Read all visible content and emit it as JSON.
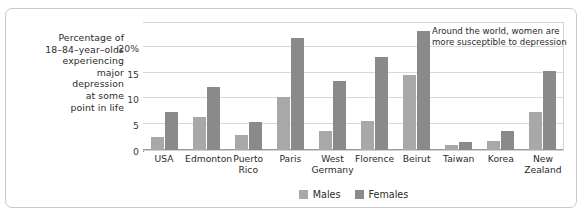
{
  "axis_label": {
    "lines": [
      "Percentage of",
      "18–84–year–olds",
      "experiencing",
      "major",
      "depression",
      "at some",
      "point in life"
    ]
  },
  "annotation": {
    "text": "Around the world, women are more susceptible to depression"
  },
  "legend": {
    "males": "Males",
    "females": "Females"
  },
  "colors": {
    "male_bar": "#a8a8a8",
    "female_bar": "#8a8a8a",
    "gridline": "#d8d8d8",
    "frame": "#c9c9c9",
    "text": "#2b2b2b"
  },
  "chart_data": {
    "type": "bar",
    "title": "",
    "xlabel": "",
    "ylabel": "Percentage of 18–84–year–olds experiencing major depression at some point in life",
    "categories": [
      "USA",
      "Edmonton",
      "Puerto Rico",
      "Paris",
      "West Germany",
      "Florence",
      "Beirut",
      "Taiwan",
      "Korea",
      "New Zealand"
    ],
    "series": [
      {
        "name": "Males",
        "values": [
          2.5,
          6.4,
          3.0,
          10.2,
          3.7,
          5.7,
          14.5,
          1.0,
          1.7,
          7.3
        ]
      },
      {
        "name": "Females",
        "values": [
          7.3,
          12.3,
          5.4,
          21.8,
          13.3,
          18.0,
          23.1,
          1.5,
          3.7,
          15.4
        ]
      }
    ],
    "ylim": [
      0,
      25
    ],
    "yticks": [
      0,
      5,
      10,
      15,
      20
    ],
    "ytick_labels": [
      "0",
      "5",
      "10",
      "15",
      "20%"
    ],
    "grid": true,
    "legend_position": "bottom",
    "annotations": [
      "Around the world, women are more susceptible to depression"
    ]
  }
}
